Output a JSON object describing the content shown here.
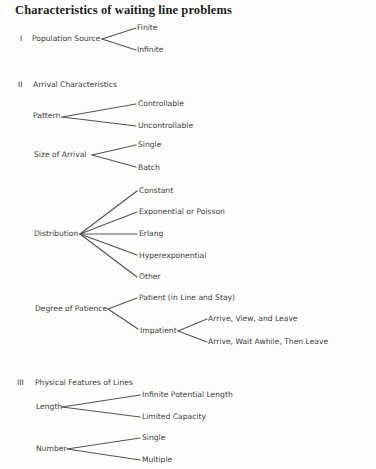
{
  "title": "Characteristics of waiting line problems",
  "sections": [
    {
      "numeral": "I",
      "label": "Population Source",
      "children": [
        "Finite",
        "Infinite"
      ]
    },
    {
      "numeral": "II",
      "label": "Arrival Characteristics",
      "groups": [
        {
          "label": "Pattern",
          "children": [
            "Controllable",
            "Uncontrollable"
          ]
        },
        {
          "label": "Size of Arrival",
          "children": [
            "Single",
            "Batch"
          ]
        },
        {
          "label": "Distribution",
          "children": [
            "Constant",
            "Exponential or Poisson",
            "Erlang",
            "Hyperexponential",
            "Other"
          ]
        },
        {
          "label": "Degree of Patience",
          "children": [
            {
              "label": "Patient (in Line and Stay)"
            },
            {
              "label": "Impatient",
              "children": [
                "Arrive, View, and Leave",
                "Arrive, Wait Awhile, Then Leave"
              ]
            }
          ]
        }
      ]
    },
    {
      "numeral": "III",
      "label": "Physical Features of Lines",
      "groups": [
        {
          "label": "Length",
          "children": [
            "Infinite Potential Length",
            "Limited Capacity"
          ]
        },
        {
          "label": "Number",
          "children": [
            "Single",
            "Multiple"
          ]
        }
      ]
    }
  ],
  "colors": {
    "text": "#3c3c3c",
    "lines": "#555555",
    "background": "#fdfdfc"
  }
}
